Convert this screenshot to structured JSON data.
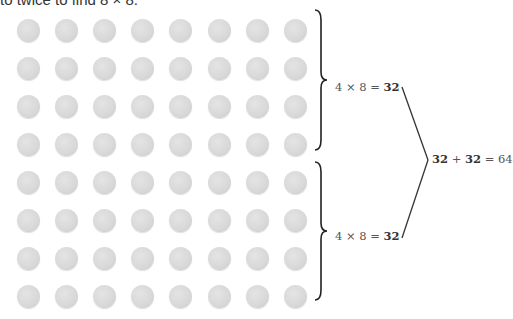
{
  "header": {
    "cropped_text": "to twice to find 8 × 8."
  },
  "array": {
    "rows": 8,
    "columns": 8,
    "dot_color": "#d9d9d9"
  },
  "groups": [
    {
      "equation_left": "4 × 8 = ",
      "equation_result": "32"
    },
    {
      "equation_left": "4 × 8 = ",
      "equation_result": "32"
    }
  ],
  "sum": {
    "a": "32",
    "plus": " + ",
    "b": "32",
    "equals": " = 64"
  }
}
